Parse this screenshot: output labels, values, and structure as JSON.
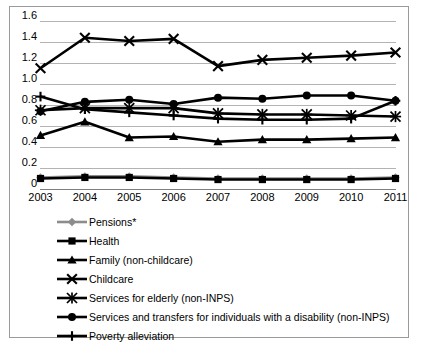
{
  "chart_data": {
    "type": "line",
    "title": "",
    "xlabel": "",
    "ylabel": "",
    "categories": [
      "2003",
      "2004",
      "2005",
      "2006",
      "2007",
      "2008",
      "2009",
      "2010",
      "2011"
    ],
    "ylim": [
      0,
      1.6
    ],
    "ytick_labels": [
      "0",
      "0.2",
      "0.4",
      "0.6",
      "0.8",
      "1.0",
      "1.2",
      "1.4",
      "1.6"
    ],
    "ytick_values": [
      0,
      0.2,
      0.4,
      0.6,
      0.8,
      1.0,
      1.2,
      1.4,
      1.6
    ],
    "grid": "horizontal",
    "legend_position": "below",
    "series": [
      {
        "name": "Pensions*",
        "marker": "diamond",
        "color": "#8c8c8c",
        "values": [
          0.11,
          0.12,
          0.12,
          0.11,
          0.1,
          0.1,
          0.1,
          0.1,
          0.11
        ]
      },
      {
        "name": "Health",
        "marker": "square",
        "color": "#000000",
        "values": [
          0.1,
          0.11,
          0.11,
          0.1,
          0.09,
          0.09,
          0.09,
          0.09,
          0.1
        ]
      },
      {
        "name": "Family (non-childcare)",
        "marker": "triangle",
        "color": "#000000",
        "values": [
          0.51,
          0.64,
          0.49,
          0.5,
          0.45,
          0.47,
          0.47,
          0.48,
          0.49
        ]
      },
      {
        "name": "Childcare",
        "marker": "cross",
        "color": "#000000",
        "values": [
          1.15,
          1.44,
          1.41,
          1.43,
          1.17,
          1.23,
          1.25,
          1.27,
          1.3
        ]
      },
      {
        "name": "Services for elderly (non-INPS)",
        "marker": "asterisk",
        "color": "#000000",
        "values": [
          0.75,
          0.77,
          0.77,
          0.77,
          0.72,
          0.71,
          0.71,
          0.7,
          0.69
        ]
      },
      {
        "name": "Services and transfers for individuals with a  disability (non-INPS)",
        "marker": "circle",
        "color": "#000000",
        "values": [
          0.74,
          0.83,
          0.85,
          0.81,
          0.87,
          0.86,
          0.89,
          0.89,
          0.84
        ]
      },
      {
        "name": "Poverty alleviation",
        "marker": "plus",
        "color": "#000000",
        "values": [
          0.88,
          0.76,
          0.73,
          0.7,
          0.67,
          0.66,
          0.66,
          0.67,
          0.84
        ]
      }
    ]
  }
}
